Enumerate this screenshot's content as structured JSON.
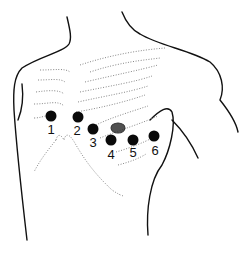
{
  "figure": {
    "electrodes": [
      {
        "label": "1",
        "x": 51,
        "y": 116
      },
      {
        "label": "2",
        "x": 78,
        "y": 117
      },
      {
        "label": "3",
        "x": 93,
        "y": 129
      },
      {
        "label": "4",
        "x": 111,
        "y": 140
      },
      {
        "label": "5",
        "x": 133,
        "y": 140
      },
      {
        "label": "6",
        "x": 154,
        "y": 136
      }
    ],
    "colors": {
      "electrode": "#0a0a0a",
      "outline": "#111111",
      "ribs": "#888888"
    }
  }
}
